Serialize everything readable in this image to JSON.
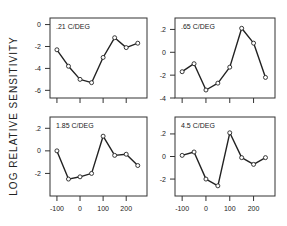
{
  "chart_data": {
    "type": "line",
    "ylabel": "LOG RELATIVE SENSITIVITY",
    "xlabel": "",
    "x": [
      -100,
      -50,
      0,
      50,
      100,
      150,
      200,
      250
    ],
    "x_ticks": [
      -100,
      0,
      100,
      200
    ],
    "x_tick_labels": [
      "-100",
      "0",
      "100",
      "200"
    ],
    "panels": [
      {
        "title": ".21 C/DEG",
        "ylim": [
          -0.67,
          0.06
        ],
        "y_ticks": [
          0,
          -0.2,
          -0.4,
          -0.6
        ],
        "y_tick_labels": [
          "0",
          "-2",
          "-4",
          "-6"
        ],
        "values": [
          -0.23,
          -0.38,
          -0.5,
          -0.53,
          -0.3,
          -0.12,
          -0.21,
          -0.17
        ],
        "show_x_labels": false
      },
      {
        "title": ".65 C/DEG",
        "ylim": [
          -0.4,
          0.3
        ],
        "y_ticks": [
          0.2,
          0,
          -0.2,
          -0.4
        ],
        "y_tick_labels": [
          ".2",
          "0",
          "-2",
          "-4"
        ],
        "values": [
          -0.17,
          -0.1,
          -0.33,
          -0.27,
          -0.13,
          0.21,
          0.08,
          -0.22
        ],
        "show_x_labels": false
      },
      {
        "title": "1.85 C/DEG",
        "ylim": [
          -0.4,
          0.3
        ],
        "y_ticks": [
          0.2,
          0,
          -0.2
        ],
        "y_tick_labels": [
          ".2",
          "0",
          "-2"
        ],
        "values": [
          0.0,
          -0.25,
          -0.23,
          -0.2,
          0.13,
          -0.04,
          -0.03,
          -0.13
        ],
        "show_x_labels": true
      },
      {
        "title": "4.5 C/DEG",
        "ylim": [
          -0.35,
          0.35
        ],
        "y_ticks": [
          0.2,
          0,
          -0.2
        ],
        "y_tick_labels": [
          ".2",
          "0",
          "-2"
        ],
        "values": [
          0.01,
          0.04,
          -0.2,
          -0.26,
          0.21,
          -0.01,
          -0.07,
          -0.01
        ],
        "show_x_labels": true
      }
    ],
    "grid": false,
    "legend": "none"
  }
}
